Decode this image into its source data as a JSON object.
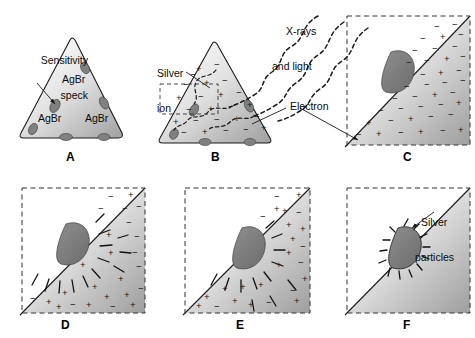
{
  "figure": {
    "panels": [
      {
        "letter": "A",
        "name": "panel-a-crystal",
        "description": "Silver bromide crystal with sensitivity specks on its surface",
        "labels": [
          "Sensitivity speck",
          "AgBr",
          "AgBr",
          "AgBr"
        ]
      },
      {
        "letter": "B",
        "name": "panel-b-exposure",
        "description": "X-rays and light strike the crystal liberating electrons from silver ions",
        "labels": [
          "X-rays and light",
          "Silver ion",
          "Electron"
        ]
      },
      {
        "letter": "C",
        "name": "panel-c-magnified",
        "description": "Magnified corner showing free electrons and silver ions",
        "labels": []
      },
      {
        "letter": "D",
        "name": "panel-d-electron-migration",
        "description": "Electrons migrate to and negatively charge the sensitivity speck",
        "labels": []
      },
      {
        "letter": "E",
        "name": "panel-e-ion-attraction",
        "description": "Positive silver ions are attracted to the negatively charged speck",
        "labels": []
      },
      {
        "letter": "F",
        "name": "panel-f-silver-particles",
        "description": "Silver ions are neutralized forming metallic silver particles",
        "labels": [
          "Silver particles"
        ]
      }
    ],
    "annotations": {
      "sensitivity_speck": "Sensitivity\nspeck",
      "sensitivity_speck_line1": "Sensitivity",
      "sensitivity_speck_line2": "speck",
      "agbr": "AgBr",
      "xrays_line1": "X-rays",
      "xrays_line2": "and light",
      "silver_ion_line1": "Silver",
      "silver_ion_line2": "ion",
      "electron": "Electron",
      "silver_particles_line1": "Silver",
      "silver_particles_line2": "particles"
    },
    "letters": {
      "a": "A",
      "b": "B",
      "c": "C",
      "d": "D",
      "e": "E",
      "f": "F"
    },
    "colors": {
      "background": "#ffffff",
      "crystal_light": "#f7f7f7",
      "crystal_dark": "#a8a8a8",
      "speck_fill": "#808080",
      "outline": "#1a1a1a",
      "dashed_border": "#333333",
      "text": "#0a0a0a"
    },
    "charges": {
      "positive": "+",
      "negative": "−"
    }
  }
}
